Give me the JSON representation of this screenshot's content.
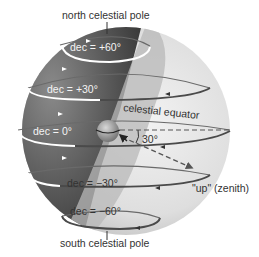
{
  "diagram": {
    "type": "celestial-sphere-declination",
    "labels": {
      "north_pole": "north celestial pole",
      "south_pole": "south celestial pole",
      "celestial_equator": "celestial equator",
      "zenith": "\"up\" (zenith)",
      "angle": "30°"
    },
    "declination_circles": [
      {
        "label": "dec = +60°",
        "dec": 60
      },
      {
        "label": "dec = +30°",
        "dec": 30
      },
      {
        "label": "dec = 0°",
        "dec": 0
      },
      {
        "label": "dec = −30°",
        "dec": -30
      },
      {
        "label": "dec = −60°",
        "dec": -60
      }
    ],
    "colors": {
      "sphere_dark": "#4a4a4a",
      "sphere_light": "#dcdcdc",
      "plane_band": "#b8b8b8",
      "circle_front": "#ffffff",
      "circle_back": "#555555",
      "text": "#333333"
    }
  }
}
